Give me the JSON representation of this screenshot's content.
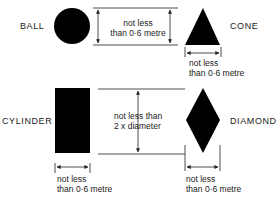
{
  "shapes": {
    "ball": {
      "label": "BALL"
    },
    "cone": {
      "label": "CONE"
    },
    "cylinder": {
      "label": "CYLINDER"
    },
    "diamond": {
      "label": "DIAMOND"
    }
  },
  "dimensions": {
    "ball_height": {
      "line1": "not less",
      "line2": "than 0·6 metre"
    },
    "cone_width": {
      "line1": "not less",
      "line2": "than 0·6 metre"
    },
    "separation": {
      "line1": "not less than",
      "line2": "2 x diameter"
    },
    "cylinder_width": {
      "line1": "not less",
      "line2": "than 0·6 metre"
    },
    "diamond_width": {
      "line1": "not less",
      "line2": "than 0·6 metre"
    }
  },
  "colors": {
    "shape_fill": "#000000",
    "line": "#222222",
    "background": "#ffffff"
  }
}
